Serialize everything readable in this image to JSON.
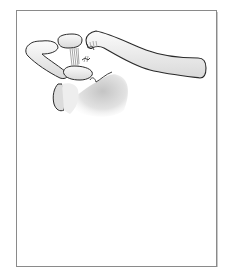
{
  "figure": {
    "frame": {
      "border_color": "#8a8a8a",
      "background": "#ffffff"
    },
    "colors": {
      "bone_fill": "#f2f2f2",
      "bone_shade": "#cfcfcf",
      "outline": "#2a2a2a",
      "ligament": "#9a9a9a"
    }
  }
}
